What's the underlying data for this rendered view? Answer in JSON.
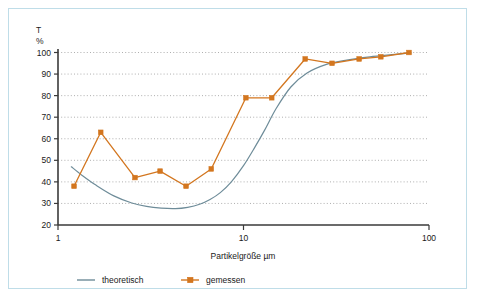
{
  "frame": {
    "border_color": "#bfdde8",
    "background": "#ffffff"
  },
  "chart_data": {
    "type": "line",
    "title": "",
    "xlabel": "Partikelgröße  µm",
    "ylabel": "T",
    "ylabel_unit": "%",
    "xscale": "log",
    "xlim": [
      1,
      100
    ],
    "ylim": [
      20,
      100
    ],
    "xticks": [
      1,
      10,
      100
    ],
    "xtick_labels": [
      "1",
      "10",
      "100"
    ],
    "yticks": [
      20,
      30,
      40,
      50,
      60,
      70,
      80,
      90,
      100
    ],
    "ytick_labels": [
      "20",
      "30",
      "40",
      "50",
      "60",
      "70",
      "80",
      "90",
      "100"
    ],
    "grid": "horizontal-dotted",
    "legend_position": "bottom-left",
    "colors": {
      "theoretisch": "#6e8c99",
      "gemessen": "#d3761f",
      "grid": "#9a9a9a",
      "axis": "#3a3a3a"
    },
    "series": [
      {
        "name": "theoretisch",
        "color": "#6e8c99",
        "marker": "none",
        "x": [
          1.18,
          1.35,
          1.6,
          2.0,
          2.5,
          3.0,
          3.6,
          4.3,
          5.0,
          5.8,
          6.6,
          7.5,
          8.6,
          10.0,
          11.5,
          13.0,
          15.0,
          18.0,
          22.0,
          28.0,
          36.0,
          48.0,
          63.0,
          80.0
        ],
        "y": [
          47.0,
          43.0,
          38.5,
          33.5,
          30.2,
          28.6,
          27.8,
          27.6,
          28.2,
          29.6,
          31.8,
          35.0,
          40.0,
          47.5,
          56.0,
          64.0,
          74.0,
          84.0,
          90.5,
          94.5,
          96.5,
          98.0,
          99.0,
          99.8
        ]
      },
      {
        "name": "gemessen",
        "color": "#d3761f",
        "marker": "square",
        "x": [
          1.22,
          1.7,
          2.6,
          3.55,
          4.9,
          6.7,
          10.3,
          14.2,
          21.5,
          30.0,
          42.0,
          55.0,
          78.0
        ],
        "y": [
          38.0,
          63.0,
          42.0,
          45.0,
          38.0,
          46.0,
          79.0,
          79.0,
          97.0,
          95.0,
          97.0,
          98.0,
          100.0
        ]
      }
    ],
    "legend": [
      {
        "label": "theoretisch",
        "color": "#6e8c99",
        "marker": "none"
      },
      {
        "label": "gemessen",
        "color": "#d3761f",
        "marker": "square"
      }
    ]
  }
}
